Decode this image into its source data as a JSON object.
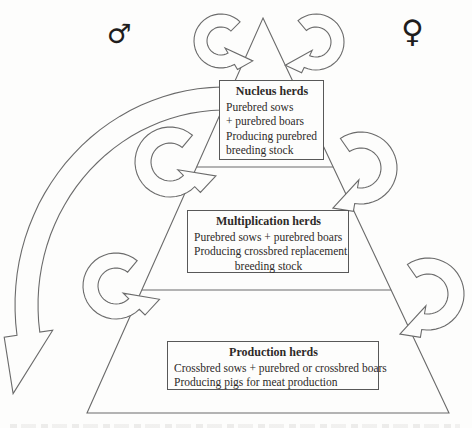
{
  "figure": {
    "male_symbol": "♂",
    "female_symbol": "♀",
    "tiers": [
      {
        "title": "Nucleus herds",
        "lines": [
          "Purebred sows",
          "+ purebred boars",
          "Producing purebred",
          "breeding stock"
        ]
      },
      {
        "title": "Multiplication herds",
        "lines": [
          "Purebred sows  + purebred boars",
          "Producing crossbred replacement",
          "breeding stock"
        ]
      },
      {
        "title": "Production herds",
        "lines": [
          "Crossbred sows + purebred or crossbred boars",
          "Producing pigs for meat production"
        ]
      }
    ],
    "colors": {
      "line": "#6b6b6b",
      "text": "#2e2a28",
      "background": "#fdfdfc"
    }
  }
}
